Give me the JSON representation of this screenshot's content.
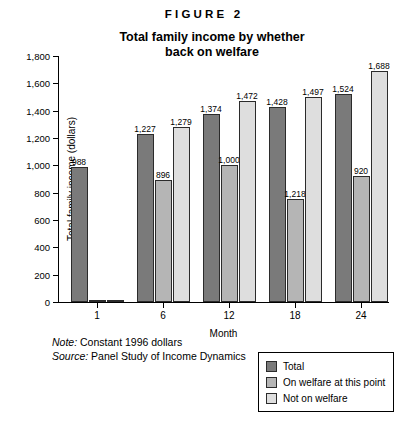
{
  "figure": {
    "number_label": "FIGURE 2",
    "title_line1": "Total family income by whether",
    "title_line2": "back on welfare"
  },
  "notes": {
    "note_lead": "Note:",
    "note_text": " Constant 1996 dollars",
    "source_lead": "Source:",
    "source_text": " Panel Study of Income Dynamics"
  },
  "legend": {
    "position": "bottom-right",
    "entries": [
      {
        "label": "Total",
        "color": "#7a7a7a"
      },
      {
        "label": "On welfare at this point",
        "color": "#b5b5b5"
      },
      {
        "label": "Not on welfare",
        "color": "#dedede"
      }
    ]
  },
  "chart_data": {
    "type": "bar",
    "title": "Total family income by whether back on welfare",
    "xlabel": "Month",
    "ylabel": "Total family income (dollars)",
    "categories": [
      "1",
      "6",
      "12",
      "18",
      "24"
    ],
    "ylim": [
      0,
      1800
    ],
    "yticks": [
      0,
      200,
      400,
      600,
      800,
      1000,
      1200,
      1400,
      1600,
      1800
    ],
    "ytick_labels": [
      "0",
      "200",
      "400",
      "600",
      "800",
      "1,000",
      "1,200",
      "1,400",
      "1,600",
      "1,800"
    ],
    "grid": false,
    "series": [
      {
        "name": "Total",
        "color": "#7a7a7a",
        "values": [
          988,
          1227,
          1374,
          1428,
          1524
        ],
        "labels": [
          "988",
          "1,227",
          "1,374",
          "1,428",
          "1,524"
        ],
        "drawn": [
          988,
          1227,
          1374,
          1428,
          1524
        ]
      },
      {
        "name": "On welfare at this point",
        "color": "#b5b5b5",
        "values": [
          0,
          896,
          1000,
          1218,
          920
        ],
        "labels": [
          "",
          "896",
          "1,000",
          "1,218",
          "920"
        ],
        "drawn": [
          0,
          896,
          1000,
          755,
          920
        ]
      },
      {
        "name": "Not on welfare",
        "color": "#dedede",
        "values": [
          0,
          1279,
          1472,
          1497,
          1688
        ],
        "labels": [
          "",
          "1,279",
          "1,472",
          "1,497",
          "1,688"
        ],
        "drawn": [
          0,
          1279,
          1472,
          1497,
          1688
        ]
      }
    ]
  }
}
